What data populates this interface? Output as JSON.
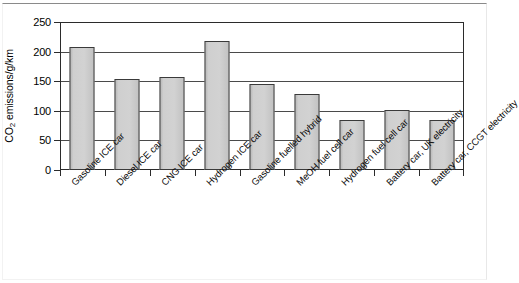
{
  "chart_data": {
    "type": "bar",
    "title": "",
    "xlabel": "",
    "ylabel": "CO2 emissions/g/km",
    "ylabel_prefix": "CO",
    "ylabel_sub": "2",
    "ylabel_suffix": " emissions/g/km",
    "ylim": [
      0,
      250
    ],
    "ytick_step": 50,
    "yticks": [
      250,
      200,
      150,
      100,
      50,
      0
    ],
    "ytick_labels": [
      "250",
      "200",
      "150",
      "100",
      "50",
      "0"
    ],
    "grid": true,
    "grid_axis": "y",
    "legend": false,
    "bar_fill_color": "#c9c9c9",
    "bar_edge_color": "#3a3a3a",
    "categories": [
      "Gasoline ICE car",
      "Diesel ICE car",
      "CNG ICE car",
      "Hydrogen ICE car",
      "Gasoline fuelled hybrid",
      "MeOH fuel cell car",
      "Hydrogen fuel cell car",
      "Battery car, UK electricity",
      "Battery car, CCGT electricity"
    ],
    "values": [
      208,
      153,
      157,
      218,
      145,
      128,
      84,
      102,
      84
    ]
  }
}
